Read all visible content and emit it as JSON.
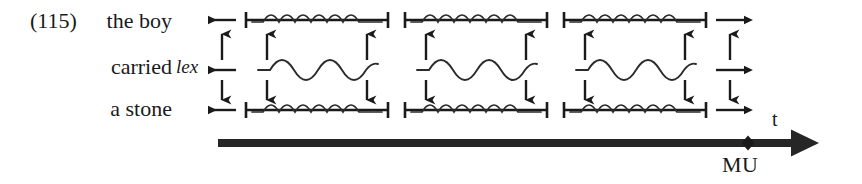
{
  "figure": {
    "example_number": "(115)",
    "rows": [
      {
        "label": "the boy",
        "type": "bracketed-wave"
      },
      {
        "label": "carried",
        "type": "free-wave",
        "annotation": "lex"
      },
      {
        "label": "a stone",
        "type": "bracketed-wave"
      }
    ],
    "axis": {
      "variable_label": "t",
      "marker_label": "MU",
      "marker_symbol": "diamond-tick"
    },
    "groups": 3,
    "arrows": {
      "left_column": [
        "left-arrow",
        "up-arrow",
        "left-arrow",
        "down-arrow",
        "left-arrow"
      ],
      "right_column": [
        "right-arrow",
        "up-arrow",
        "right-arrow",
        "down-arrow",
        "right-arrow"
      ],
      "inner_vertical": [
        "up-arrow",
        "down-arrow"
      ]
    },
    "colors": {
      "ink": "#1a1a1a",
      "wave": "#2b2b2b",
      "background": "#ffffff"
    }
  }
}
